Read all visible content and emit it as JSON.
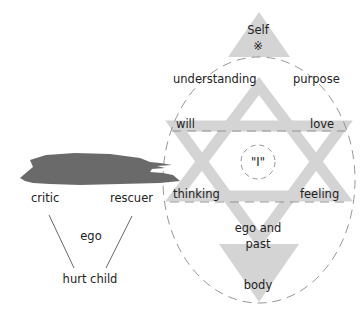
{
  "colors": {
    "band_fill": "#d4d4d4",
    "shadow_fill": "#6a6a6a",
    "dash_stroke": "#8a8a8a",
    "text": "#222222",
    "line": "#555555"
  },
  "self": {
    "label": "Self",
    "symbol": "※"
  },
  "star_labels": {
    "understanding": "understanding",
    "purpose": "purpose",
    "will": "will",
    "love": "love",
    "center": "\"I\"",
    "thinking": "thinking",
    "feeling": "feeling",
    "ego_and_past_line1": "ego and",
    "ego_and_past_line2": "past",
    "body": "body"
  },
  "ego_group": {
    "critic": "critic",
    "rescuer": "rescuer",
    "ego": "ego",
    "hurt_child": "hurt child"
  }
}
